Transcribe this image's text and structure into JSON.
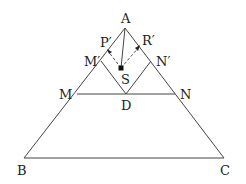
{
  "diagram": {
    "type": "geometry",
    "points": {
      "A": {
        "label": "A",
        "x": 125,
        "y": 28
      },
      "B": {
        "label": "B",
        "x": 24,
        "y": 158
      },
      "C": {
        "label": "C",
        "x": 224,
        "y": 158
      },
      "M": {
        "label": "M",
        "x": 77,
        "y": 94
      },
      "N": {
        "label": "N",
        "x": 175,
        "y": 94
      },
      "D": {
        "label": "D",
        "x": 126,
        "y": 94
      },
      "M_prime": {
        "label": "M′",
        "x": 101,
        "y": 61
      },
      "N_prime": {
        "label": "N′",
        "x": 151,
        "y": 61
      },
      "P_prime": {
        "label": "P′",
        "x": 108,
        "y": 50
      },
      "R_prime": {
        "label": "R′",
        "x": 139,
        "y": 46
      },
      "S": {
        "label": "S",
        "x": 121,
        "y": 68
      }
    },
    "segments": [
      "A-B",
      "A-C",
      "B-C",
      "M-N",
      "M′-D",
      "N′-D",
      "A-S"
    ],
    "dashed_segments": [
      "P′-S",
      "R′-S"
    ],
    "arrows": [
      "S→P′",
      "S→R′"
    ]
  }
}
